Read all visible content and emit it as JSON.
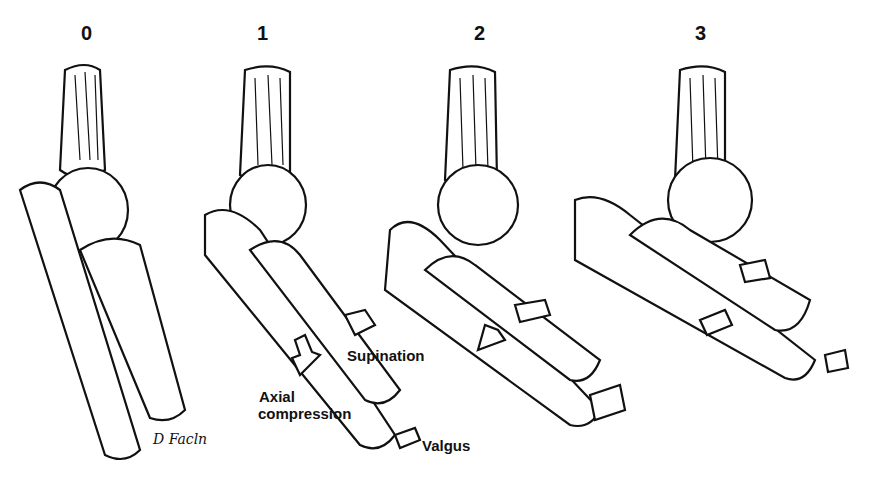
{
  "figure": {
    "stages": [
      {
        "number": "0"
      },
      {
        "number": "1"
      },
      {
        "number": "2"
      },
      {
        "number": "3"
      }
    ],
    "labels": {
      "supination": "Supination",
      "axial_line1": "Axial",
      "axial_line2": "compression",
      "valgus": "Valgus"
    },
    "signature": "D Facln"
  }
}
